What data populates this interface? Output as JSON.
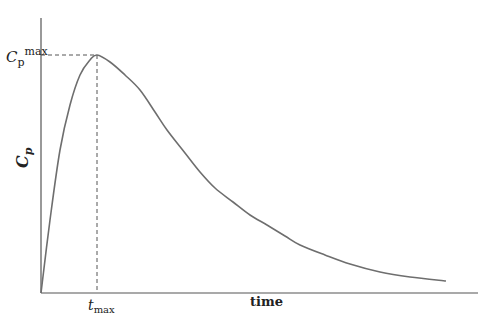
{
  "chart_data": {
    "type": "line",
    "title": "",
    "xlabel": "time",
    "ylabel": "C_p",
    "ylabel_main": "C",
    "ylabel_sub": "p",
    "annotations": {
      "peak_y_label_main": "C",
      "peak_y_label_sub": "p",
      "peak_y_label_sup": "max",
      "peak_x_label_main": "t",
      "peak_x_label_sub": "max"
    },
    "grid": false,
    "legend": null,
    "line_color": "#6e6e6e",
    "axis_color": "#555555",
    "series": [
      {
        "name": "Cp",
        "points_px": [
          [
            41,
            293
          ],
          [
            50,
            220
          ],
          [
            60,
            150
          ],
          [
            70,
            105
          ],
          [
            80,
            75
          ],
          [
            90,
            60
          ],
          [
            97,
            55
          ],
          [
            110,
            62
          ],
          [
            125,
            75
          ],
          [
            140,
            90
          ],
          [
            155,
            112
          ],
          [
            167,
            130
          ],
          [
            185,
            153
          ],
          [
            200,
            172
          ],
          [
            215,
            188
          ],
          [
            233,
            202
          ],
          [
            250,
            215
          ],
          [
            267,
            225
          ],
          [
            285,
            236
          ],
          [
            300,
            245
          ],
          [
            325,
            255
          ],
          [
            350,
            264
          ],
          [
            380,
            272
          ],
          [
            410,
            277
          ],
          [
            446,
            281
          ]
        ]
      }
    ],
    "peak_px": [
      97,
      55
    ]
  }
}
